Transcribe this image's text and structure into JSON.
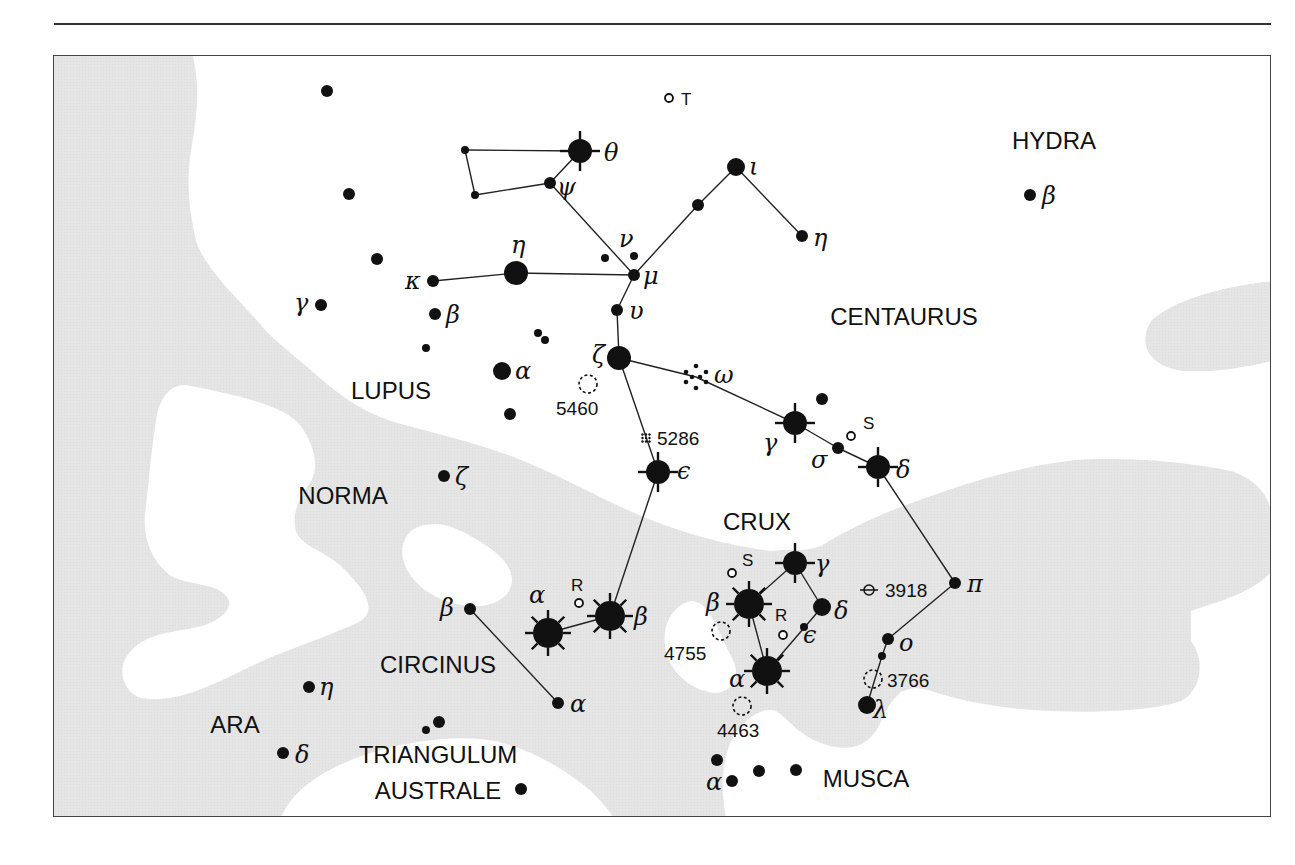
{
  "map": {
    "type": "star_chart",
    "colors": {
      "milky_way": "#e6e6e6",
      "background": "#ffffff",
      "ink": "#111111"
    },
    "constellations": [
      {
        "name": "HYDRA",
        "x": 1053,
        "y": 148
      },
      {
        "name": "CENTAURUS",
        "x": 903,
        "y": 324
      },
      {
        "name": "LUPUS",
        "x": 390,
        "y": 398
      },
      {
        "name": "NORMA",
        "x": 342,
        "y": 503
      },
      {
        "name": "CRUX",
        "x": 756,
        "y": 529
      },
      {
        "name": "CIRCINUS",
        "x": 437,
        "y": 672
      },
      {
        "name": "ARA",
        "x": 234,
        "y": 732
      },
      {
        "name": "TRIANGULUM",
        "x": 437,
        "y": 762
      },
      {
        "name": "AUSTRALE",
        "x": 437,
        "y": 798
      },
      {
        "name": "MUSCA",
        "x": 865,
        "y": 786
      }
    ],
    "stars": [
      {
        "id": "cen-theta",
        "label": "θ",
        "x": 579,
        "y": 150,
        "kind": "bright",
        "lx": 603,
        "ly": 160
      },
      {
        "id": "cen-psi",
        "label": "ψ",
        "x": 549,
        "y": 182,
        "kind": "small",
        "lx": 556,
        "ly": 194
      },
      {
        "id": "cen-a1",
        "label": "",
        "x": 464,
        "y": 149,
        "kind": "tiny"
      },
      {
        "id": "cen-a2",
        "label": "",
        "x": 474,
        "y": 194,
        "kind": "tiny"
      },
      {
        "id": "cen-iota",
        "label": "ι",
        "x": 735,
        "y": 166,
        "kind": "medium",
        "lx": 748,
        "ly": 174
      },
      {
        "id": "cen-b1",
        "label": "",
        "x": 697,
        "y": 204,
        "kind": "small"
      },
      {
        "id": "cen-eta",
        "label": "η",
        "x": 801,
        "y": 235,
        "kind": "small",
        "lx": 812,
        "ly": 245
      },
      {
        "id": "cen-nu",
        "label": "ν",
        "x": 633,
        "y": 255,
        "kind": "tiny",
        "lx": 618,
        "ly": 246
      },
      {
        "id": "cen-nu2",
        "label": "",
        "x": 604,
        "y": 257,
        "kind": "tiny"
      },
      {
        "id": "cen-mu",
        "label": "μ",
        "x": 633,
        "y": 274,
        "kind": "small",
        "lx": 642,
        "ly": 283
      },
      {
        "id": "cen-upsilon",
        "label": "υ",
        "x": 616,
        "y": 309,
        "kind": "small",
        "lx": 628,
        "ly": 318
      },
      {
        "id": "cen-zeta",
        "label": "ζ",
        "x": 618,
        "y": 357,
        "kind": "large",
        "lx": 591,
        "ly": 362
      },
      {
        "id": "cen-omega",
        "label": "ω",
        "x": 695,
        "y": 376,
        "kind": "cluster",
        "lx": 713,
        "ly": 382
      },
      {
        "id": "cen-gamma",
        "label": "γ",
        "x": 794,
        "y": 422,
        "kind": "bright",
        "lx": 762,
        "ly": 450
      },
      {
        "id": "cen-c1",
        "label": "",
        "x": 821,
        "y": 398,
        "kind": "small"
      },
      {
        "id": "cen-sigma",
        "label": "σ",
        "x": 837,
        "y": 447,
        "kind": "small",
        "lx": 810,
        "ly": 467
      },
      {
        "id": "cen-delta",
        "label": "δ",
        "x": 877,
        "y": 466,
        "kind": "bright",
        "lx": 895,
        "ly": 477
      },
      {
        "id": "cen-epsilon",
        "label": "ϵ",
        "x": 657,
        "y": 471,
        "kind": "bright",
        "lx": 676,
        "ly": 478
      },
      {
        "id": "cen-pi",
        "label": "π",
        "x": 954,
        "y": 582,
        "kind": "small",
        "lx": 966,
        "ly": 591
      },
      {
        "id": "cen-o",
        "label": "o",
        "x": 887,
        "y": 638,
        "kind": "small",
        "lx": 898,
        "ly": 650
      },
      {
        "id": "cen-o2",
        "label": "",
        "x": 881,
        "y": 655,
        "kind": "tiny"
      },
      {
        "id": "cen-lambda",
        "label": "λ",
        "x": 866,
        "y": 704,
        "kind": "medium",
        "lx": 872,
        "ly": 717
      },
      {
        "id": "cen-alpha",
        "label": "α",
        "x": 547,
        "y": 632,
        "kind": "brightest",
        "lx": 528,
        "ly": 602
      },
      {
        "id": "cen-beta",
        "label": "β",
        "x": 609,
        "y": 615,
        "kind": "brightest",
        "lx": 633,
        "ly": 624
      },
      {
        "id": "cru-gamma",
        "label": "γ",
        "x": 794,
        "y": 562,
        "kind": "bright",
        "lx": 814,
        "ly": 571
      },
      {
        "id": "cru-beta",
        "label": "β",
        "x": 748,
        "y": 603,
        "kind": "brightest",
        "lx": 705,
        "ly": 610
      },
      {
        "id": "cru-delta",
        "label": "δ",
        "x": 821,
        "y": 606,
        "kind": "medium",
        "lx": 833,
        "ly": 618
      },
      {
        "id": "cru-epsilon",
        "label": "ϵ",
        "x": 803,
        "y": 626,
        "kind": "tiny",
        "lx": 802,
        "ly": 642
      },
      {
        "id": "cru-alpha",
        "label": "α",
        "x": 766,
        "y": 670,
        "kind": "brightest",
        "lx": 728,
        "ly": 686
      },
      {
        "id": "lup-eta",
        "label": "η",
        "x": 515,
        "y": 272,
        "kind": "large",
        "lx": 510,
        "ly": 252
      },
      {
        "id": "lup-kappa",
        "label": "κ",
        "x": 432,
        "y": 280,
        "kind": "small",
        "lx": 404,
        "ly": 288
      },
      {
        "id": "lup-beta",
        "label": "β",
        "x": 434,
        "y": 313,
        "kind": "small",
        "lx": 445,
        "ly": 322
      },
      {
        "id": "lup-gamma",
        "label": "γ",
        "x": 320,
        "y": 304,
        "kind": "small",
        "lx": 293,
        "ly": 310
      },
      {
        "id": "lup-alpha",
        "label": "α",
        "x": 501,
        "y": 370,
        "kind": "medium",
        "lx": 514,
        "ly": 378
      },
      {
        "id": "lup-d1",
        "label": "",
        "x": 326,
        "y": 90,
        "kind": "small"
      },
      {
        "id": "lup-d2",
        "label": "",
        "x": 348,
        "y": 193,
        "kind": "small"
      },
      {
        "id": "lup-d3",
        "label": "",
        "x": 376,
        "y": 258,
        "kind": "small"
      },
      {
        "id": "lup-d4",
        "label": "",
        "x": 425,
        "y": 347,
        "kind": "tiny"
      },
      {
        "id": "lup-d5",
        "label": "",
        "x": 537,
        "y": 332,
        "kind": "tiny"
      },
      {
        "id": "lup-d6",
        "label": "",
        "x": 544,
        "y": 339,
        "kind": "tiny"
      },
      {
        "id": "lup-d7",
        "label": "",
        "x": 509,
        "y": 413,
        "kind": "small"
      },
      {
        "id": "hya-beta",
        "label": "β",
        "x": 1029,
        "y": 194,
        "kind": "small",
        "lx": 1041,
        "ly": 203
      },
      {
        "id": "nor-zeta",
        "label": "ζ",
        "x": 443,
        "y": 475,
        "kind": "small",
        "lx": 454,
        "ly": 484
      },
      {
        "id": "cir-beta",
        "label": "β",
        "x": 469,
        "y": 608,
        "kind": "small",
        "lx": 439,
        "ly": 615
      },
      {
        "id": "cir-alpha",
        "label": "α",
        "x": 557,
        "y": 702,
        "kind": "small",
        "lx": 569,
        "ly": 711
      },
      {
        "id": "ara-eta",
        "label": "η",
        "x": 308,
        "y": 686,
        "kind": "small",
        "lx": 318,
        "ly": 694
      },
      {
        "id": "ara-delta",
        "label": "δ",
        "x": 282,
        "y": 752,
        "kind": "small",
        "lx": 294,
        "ly": 762
      },
      {
        "id": "tra-1",
        "label": "",
        "x": 438,
        "y": 721,
        "kind": "small"
      },
      {
        "id": "tra-2",
        "label": "",
        "x": 425,
        "y": 729,
        "kind": "tiny"
      },
      {
        "id": "tra-3",
        "label": "",
        "x": 520,
        "y": 788,
        "kind": "small"
      },
      {
        "id": "mus-alpha",
        "label": "α",
        "x": 731,
        "y": 780,
        "kind": "small",
        "lx": 705,
        "ly": 789
      },
      {
        "id": "mus-1",
        "label": "",
        "x": 716,
        "y": 759,
        "kind": "small"
      },
      {
        "id": "mus-2",
        "label": "",
        "x": 758,
        "y": 770,
        "kind": "small"
      },
      {
        "id": "mus-3",
        "label": "",
        "x": 795,
        "y": 769,
        "kind": "small"
      }
    ],
    "variables": [
      {
        "label": "T",
        "x": 668,
        "y": 97,
        "lx": 680,
        "ly": 104
      },
      {
        "label": "S",
        "x": 850,
        "y": 435,
        "lx": 862,
        "ly": 428
      },
      {
        "label": "R",
        "x": 578,
        "y": 602,
        "lx": 570,
        "ly": 590
      },
      {
        "label": "S",
        "x": 731,
        "y": 572,
        "lx": 741,
        "ly": 565
      },
      {
        "label": "R",
        "x": 782,
        "y": 634,
        "lx": 774,
        "ly": 620
      }
    ],
    "deep_sky": [
      {
        "label": "5460",
        "x": 587,
        "y": 383,
        "kind": "open-cluster",
        "lx": 555,
        "ly": 414
      },
      {
        "label": "5286",
        "x": 645,
        "y": 437,
        "kind": "globular",
        "lx": 656,
        "ly": 444
      },
      {
        "label": "3918",
        "x": 868,
        "y": 589,
        "kind": "planetary",
        "lx": 884,
        "ly": 596
      },
      {
        "label": "4755",
        "x": 720,
        "y": 630,
        "kind": "open-cluster",
        "lx": 663,
        "ly": 659
      },
      {
        "label": "3766",
        "x": 872,
        "y": 678,
        "kind": "open-cluster",
        "lx": 886,
        "ly": 686
      },
      {
        "label": "4463",
        "x": 741,
        "y": 705,
        "kind": "open-cluster",
        "lx": 716,
        "ly": 736
      }
    ],
    "lines": [
      [
        "cen-a1",
        "cen-theta"
      ],
      [
        "cen-a1",
        "cen-a2"
      ],
      [
        "cen-a2",
        "cen-psi"
      ],
      [
        "cen-psi",
        "cen-theta"
      ],
      [
        "cen-psi",
        "cen-mu"
      ],
      [
        "cen-mu",
        "cen-b1"
      ],
      [
        "cen-b1",
        "cen-iota"
      ],
      [
        "cen-iota",
        "cen-eta"
      ],
      [
        "lup-kappa",
        "lup-eta"
      ],
      [
        "lup-eta",
        "cen-mu"
      ],
      [
        "cen-mu",
        "cen-upsilon"
      ],
      [
        "cen-upsilon",
        "cen-zeta"
      ],
      [
        "cen-zeta",
        "cen-omega"
      ],
      [
        "cen-omega",
        "cen-gamma"
      ],
      [
        "cen-gamma",
        "cen-sigma"
      ],
      [
        "cen-sigma",
        "cen-delta"
      ],
      [
        "cen-delta",
        "cen-pi"
      ],
      [
        "cen-pi",
        "cen-o"
      ],
      [
        "cen-o",
        "cen-o2"
      ],
      [
        "cen-o2",
        "cen-lambda"
      ],
      [
        "cen-zeta",
        "cen-epsilon"
      ],
      [
        "cen-epsilon",
        "cen-beta"
      ],
      [
        "cen-beta",
        "cen-alpha"
      ],
      [
        "cru-gamma",
        "cru-beta"
      ],
      [
        "cru-gamma",
        "cru-delta"
      ],
      [
        "cru-delta",
        "cru-alpha"
      ],
      [
        "cru-beta",
        "cru-alpha"
      ],
      [
        "cir-beta",
        "cir-alpha"
      ]
    ]
  }
}
